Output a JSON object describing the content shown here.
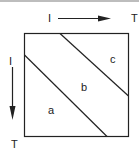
{
  "diagram": {
    "top_axis": {
      "start_label": "I",
      "end_label": "T"
    },
    "left_axis": {
      "start_label": "I",
      "end_label": "T"
    },
    "regions": {
      "a": "a",
      "b": "b",
      "c": "c"
    },
    "colors": {
      "line": "#222222",
      "background": "#ffffff",
      "top_bar": "#bdbdbd"
    }
  }
}
